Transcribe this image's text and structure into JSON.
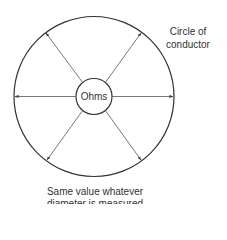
{
  "diagram": {
    "center_label": "Ohms",
    "outer_label_line1": "Circle of",
    "outer_label_line2": "conductor",
    "caption_line1": "Same value whatever",
    "caption_line2": "diameter is measured",
    "colors": {
      "stroke": "#333333",
      "arrow": "#555555",
      "text": "#333333"
    }
  }
}
